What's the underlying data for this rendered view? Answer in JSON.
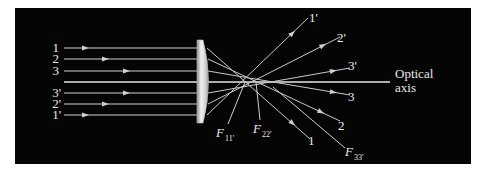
{
  "diagram": {
    "background": "#050505",
    "ray_color": "#cfcfcf",
    "incoming_rays": [
      {
        "label": "1",
        "y": 48
      },
      {
        "label": "2",
        "y": 59
      },
      {
        "label": "3",
        "y": 71
      },
      {
        "label": "3'",
        "y": 93
      },
      {
        "label": "2'",
        "y": 104
      },
      {
        "label": "1'",
        "y": 115
      }
    ],
    "outgoing_labels": {
      "r1p": "1'",
      "r2p": "2'",
      "r3p": "3'",
      "r3": "3",
      "r2": "2",
      "r1": "1"
    },
    "axis_label_line1": "Optical",
    "axis_label_line2": "axis",
    "focal_points": {
      "f11": {
        "main": "F",
        "sub": "11'"
      },
      "f22": {
        "main": "F",
        "sub": "22'"
      },
      "f33": {
        "main": "F",
        "sub": "33'"
      }
    }
  }
}
